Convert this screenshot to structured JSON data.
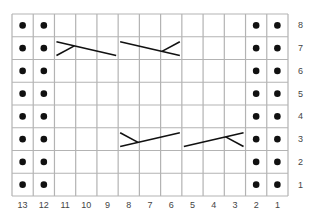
{
  "chart_data": {
    "type": "knitting-chart",
    "columns": 13,
    "rows": 8,
    "column_labels": [
      "13",
      "12",
      "11",
      "10",
      "9",
      "8",
      "7",
      "6",
      "5",
      "4",
      "3",
      "2",
      "1"
    ],
    "row_labels": [
      "8",
      "7",
      "6",
      "5",
      "4",
      "3",
      "2",
      "1"
    ],
    "purl_columns": [
      13,
      12,
      2,
      1
    ],
    "purl_symbol": "dot",
    "cables": [
      {
        "row": 7,
        "from_col": 11,
        "to_col": 9,
        "type": "left-branch",
        "desc": "line descending left-to-right with short branch at left"
      },
      {
        "row": 7,
        "from_col": 8,
        "to_col": 6,
        "type": "right-branch",
        "desc": "line descending left-to-right with short branch at right"
      },
      {
        "row": 3,
        "from_col": 8,
        "to_col": 6,
        "type": "left-branch",
        "desc": "line ascending left-to-right with short branch at left"
      },
      {
        "row": 3,
        "from_col": 5,
        "to_col": 3,
        "type": "right-branch",
        "desc": "line ascending left-to-right with short branch at right"
      }
    ],
    "colors": {
      "grid": "#b3b3b3",
      "symbol": "#111111",
      "label": "#444444"
    }
  }
}
